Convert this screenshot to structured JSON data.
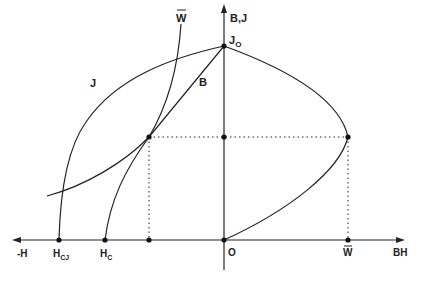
{
  "diagram": {
    "type": "demagnetization-curve-diagram",
    "axes": {
      "vertical_label": "B,J",
      "horizontal_negative_label": "-H",
      "horizontal_positive_label": "BH",
      "origin_label": "O"
    },
    "curve_labels": {
      "J": "J",
      "B": "B",
      "W_bar": "W",
      "J0_main": "J",
      "J0_sub": "O"
    },
    "tick_labels": {
      "HcJ_main": "H",
      "HcJ_sub": "CJ",
      "Hc_main": "H",
      "Hc_sub": "C",
      "W_bar_axis": "W"
    },
    "colors": {
      "ink": "#222222",
      "background": "#ffffff"
    }
  }
}
